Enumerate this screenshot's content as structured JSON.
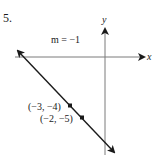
{
  "problem": {
    "number": "5."
  },
  "graph": {
    "slope_label": "m = −1",
    "x_axis_label": "x",
    "y_axis_label": "y",
    "points": [
      {
        "label": "(−3, −4)",
        "x": -3,
        "y": -4
      },
      {
        "label": "(−2, −5)",
        "x": -2,
        "y": -5
      }
    ],
    "line": {
      "slope": -1,
      "intercept": -7
    },
    "colors": {
      "ink": "#1a1a1a",
      "axis": "#7a7a7a",
      "background": "#ffffff"
    }
  }
}
